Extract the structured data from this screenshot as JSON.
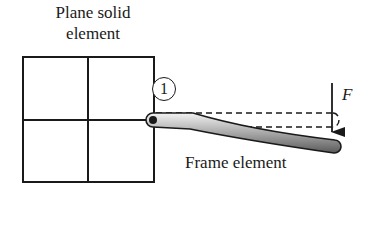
{
  "diagram": {
    "plane_solid_label_line1": "Plane solid",
    "plane_solid_label_line2": "element",
    "node_number": "1",
    "force_label": "F",
    "frame_label": "Frame element",
    "colors": {
      "stroke": "#1a1a1a",
      "beam_fill_light": "#eeeeee",
      "beam_fill_dark": "#7a7a7a"
    }
  }
}
